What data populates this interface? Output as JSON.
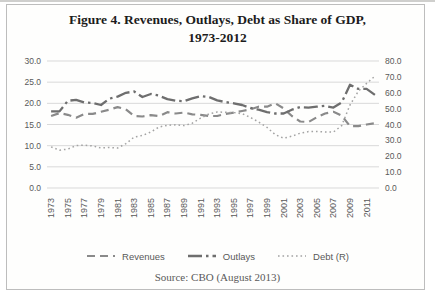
{
  "title": {
    "line1": "Figure 4. Revenues, Outlays, Debt as Share of GDP,",
    "line2": "1973-2012"
  },
  "caption": "Source: CBO (August 2013)",
  "colors": {
    "gridline": "#d9d9d9",
    "tick_text": "#595959",
    "frame_border": "#bdbdbd",
    "revenues_line": "#8a8a8a",
    "outlays_line": "#6e6e6e",
    "debt_line": "#a3a3a3"
  },
  "chart_data": {
    "type": "line",
    "title": "Figure 4. Revenues, Outlays, Debt as Share of GDP, 1973-2012",
    "xlabel": "",
    "ylabel_left": "",
    "ylabel_right": "",
    "grid": "horizontal",
    "legend_position": "bottom",
    "x": [
      1973,
      1974,
      1975,
      1976,
      1977,
      1978,
      1979,
      1980,
      1981,
      1982,
      1983,
      1984,
      1985,
      1986,
      1987,
      1988,
      1989,
      1990,
      1991,
      1992,
      1993,
      1994,
      1995,
      1996,
      1997,
      1998,
      1999,
      2000,
      2001,
      2002,
      2003,
      2004,
      2005,
      2006,
      2007,
      2008,
      2009,
      2010,
      2011,
      2012
    ],
    "x_tick_labels": [
      "1973",
      "1975",
      "1977",
      "1979",
      "1981",
      "1983",
      "1985",
      "1987",
      "1989",
      "1991",
      "1993",
      "1995",
      "1997",
      "1999",
      "2001",
      "2003",
      "2005",
      "2007",
      "2009",
      "2011"
    ],
    "left_axis": {
      "min": 0,
      "max": 30,
      "step": 5,
      "tick_labels": [
        "0.0",
        "5.0",
        "10.0",
        "15.0",
        "20.0",
        "25.0",
        "30.0"
      ]
    },
    "right_axis": {
      "min": 0,
      "max": 80,
      "step": 10,
      "tick_labels": [
        "0.0",
        "10.0",
        "20.0",
        "30.0",
        "40.0",
        "50.0",
        "60.0",
        "70.0",
        "80.0"
      ]
    },
    "series": [
      {
        "name": "Revenues",
        "axis": "left",
        "style": "dashed",
        "color": "#8a8a8a",
        "values": [
          17.0,
          17.7,
          17.3,
          16.6,
          17.5,
          17.5,
          18.0,
          18.5,
          19.1,
          18.6,
          17.0,
          16.9,
          17.2,
          17.0,
          17.9,
          17.6,
          17.8,
          17.4,
          17.3,
          17.0,
          17.0,
          17.5,
          17.8,
          18.2,
          18.6,
          19.2,
          19.2,
          20.0,
          18.8,
          17.0,
          15.7,
          15.6,
          16.7,
          17.6,
          18.0,
          17.1,
          14.6,
          14.6,
          15.0,
          15.3
        ]
      },
      {
        "name": "Outlays",
        "axis": "left",
        "style": "dash-dot",
        "color": "#6e6e6e",
        "values": [
          18.1,
          18.1,
          20.6,
          20.8,
          20.2,
          20.1,
          19.6,
          21.1,
          21.6,
          22.5,
          22.8,
          21.5,
          22.2,
          21.8,
          21.0,
          20.6,
          20.5,
          21.2,
          21.7,
          21.5,
          20.7,
          20.3,
          20.0,
          19.6,
          18.9,
          18.5,
          17.9,
          17.6,
          17.6,
          18.5,
          19.1,
          19.0,
          19.2,
          19.4,
          19.0,
          20.2,
          24.4,
          23.4,
          23.4,
          22.0
        ]
      },
      {
        "name": "Debt (R)",
        "axis": "right",
        "style": "dotted",
        "color": "#a3a3a3",
        "values": [
          25.9,
          23.8,
          24.5,
          26.7,
          27.0,
          26.5,
          25.2,
          25.5,
          25.2,
          27.9,
          32.1,
          33.1,
          35.3,
          38.4,
          39.5,
          39.8,
          39.3,
          40.8,
          44.0,
          46.6,
          47.9,
          47.7,
          47.5,
          46.8,
          44.5,
          41.6,
          38.2,
          33.6,
          31.4,
          32.6,
          34.5,
          35.5,
          35.6,
          35.3,
          35.2,
          39.3,
          52.3,
          60.9,
          65.9,
          70.4
        ]
      }
    ]
  }
}
